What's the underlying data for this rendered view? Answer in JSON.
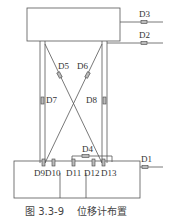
{
  "figure": {
    "caption": "图 3.3-9    位移计布置",
    "labels": {
      "D1": "D1",
      "D2": "D2",
      "D3": "D3",
      "D4": "D4",
      "D5": "D5",
      "D6": "D6",
      "D7": "D7",
      "D8": "D8",
      "D9": "D9",
      "D10": "D10",
      "D11": "D11",
      "D12": "D12",
      "D13": "D13"
    },
    "colors": {
      "line": "#555555",
      "gauge": "#bbbbbb",
      "text": "#333333"
    }
  }
}
